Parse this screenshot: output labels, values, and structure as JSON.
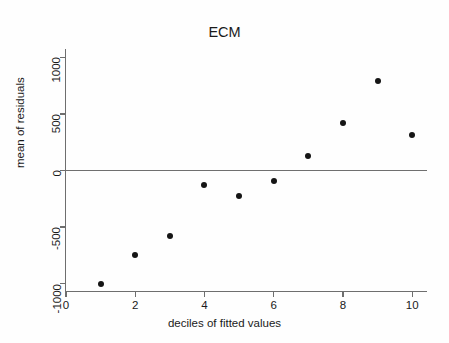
{
  "chart_data": {
    "type": "scatter",
    "title": "ECM",
    "xlabel": "deciles of fitted values",
    "ylabel": "mean of residuals",
    "x": [
      1,
      2,
      3,
      4,
      5,
      6,
      7,
      8,
      9,
      10
    ],
    "values": [
      -1000,
      -745,
      -580,
      -125,
      -225,
      -90,
      130,
      420,
      790,
      310
    ],
    "series": [
      {
        "name": "mean of residuals",
        "x": [
          1,
          2,
          3,
          4,
          5,
          6,
          7,
          8,
          9,
          10
        ],
        "values": [
          -1000,
          -745,
          -580,
          -125,
          -225,
          -90,
          130,
          420,
          790,
          310
        ]
      }
    ],
    "xlim": [
      0,
      10.4
    ],
    "ylim": [
      -1075,
      1100
    ],
    "xticks": [
      0,
      2,
      4,
      6,
      8,
      10
    ],
    "xtick_labels": [
      "0",
      "2",
      "4",
      "6",
      "8",
      "10"
    ],
    "yticks": [
      -1000,
      -500,
      0,
      500,
      1000
    ],
    "ytick_labels": [
      "-1000",
      "-500",
      "0",
      "500",
      "1000"
    ],
    "grid": false,
    "legend": null,
    "annotations": [
      {
        "type": "reference-line",
        "orientation": "horizontal",
        "value": 0
      }
    ],
    "marker": "filled-circle",
    "colors": {
      "marker": "#151515",
      "axis": "#6e6e6e",
      "zero_line": "#6f6f6f",
      "background": "#fefefe",
      "text": "#1a1a1a"
    }
  }
}
